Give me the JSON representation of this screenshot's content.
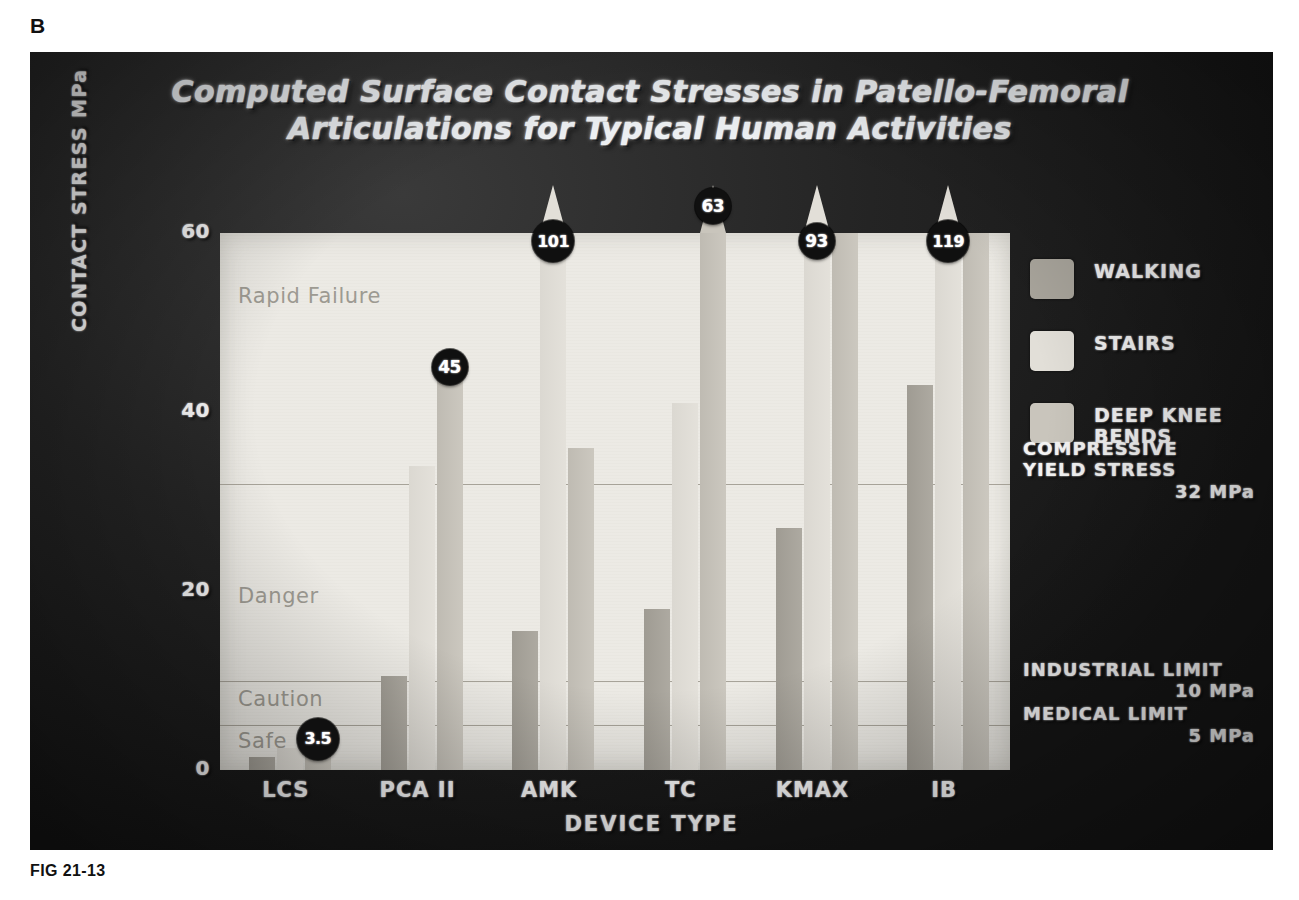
{
  "panel_label": "B",
  "caption": "FIG 21-13",
  "title": {
    "line1": "Computed Surface Contact Stresses in Patello-Femoral",
    "line2": "Articulations for Typical Human Activities"
  },
  "axes": {
    "y_title": "CONTACT STRESS MPa",
    "x_title": "DEVICE  TYPE",
    "y_ticks": [
      "0",
      "20",
      "40",
      "60"
    ]
  },
  "zones": [
    {
      "name": "Safe",
      "label": "Safe"
    },
    {
      "name": "Caution",
      "label": "Caution"
    },
    {
      "name": "Danger",
      "label": "Danger"
    },
    {
      "name": "Rapid Failure",
      "label": "Rapid Failure"
    }
  ],
  "legend": {
    "items": [
      {
        "label": "WALKING",
        "color": "#a9a59c"
      },
      {
        "label": "STAIRS",
        "color": "#e2dfd8"
      },
      {
        "label": "DEEP KNEE\nBENDS",
        "color": "#c9c5bc"
      }
    ]
  },
  "legend_labels": {
    "walking": "WALKING",
    "stairs": "STAIRS",
    "deep_knee_bends_l1": "DEEP KNEE",
    "deep_knee_bends_l2": "BENDS"
  },
  "annotations": [
    {
      "line1": "COMPRESSIVE",
      "line2": "YIELD STRESS",
      "value": "32 MPa",
      "at": 32
    },
    {
      "line1": "INDUSTRIAL  LIMIT",
      "line2": "",
      "value": "10 MPa",
      "at": 10
    },
    {
      "line1": "MEDICAL  LIMIT",
      "line2": "",
      "value": "5 MPa",
      "at": 5
    }
  ],
  "annotation_text": {
    "compressive_l1": "COMPRESSIVE",
    "compressive_l2": "YIELD STRESS",
    "compressive_val": "32 MPa",
    "industrial_l1": "INDUSTRIAL  LIMIT",
    "industrial_val": "10 MPa",
    "medical_l1": "MEDICAL  LIMIT",
    "medical_val": "5 MPa"
  },
  "chart_data": {
    "type": "bar",
    "title": "Computed Surface Contact Stresses in Patello-Femoral Articulations for Typical Human Activities",
    "xlabel": "DEVICE TYPE",
    "ylabel": "CONTACT STRESS MPa",
    "ylim": [
      0,
      60
    ],
    "yticks": [
      0,
      20,
      40,
      60
    ],
    "grid": true,
    "legend_position": "right",
    "categories": [
      "LCS",
      "PCA II",
      "AMK",
      "TC",
      "KMAX",
      "IB"
    ],
    "series": [
      {
        "name": "WALKING",
        "color": "#a9a59c",
        "values": [
          1.5,
          10.5,
          15.5,
          18.0,
          27.0,
          43.0
        ]
      },
      {
        "name": "STAIRS",
        "color": "#e2dfd8",
        "values": [
          2.5,
          34.0,
          101.0,
          41.0,
          93.0,
          119.0
        ]
      },
      {
        "name": "DEEP KNEE BENDS",
        "color": "#c9c5bc",
        "values": [
          3.5,
          45.0,
          36.0,
          63.0,
          60.0,
          60.0
        ]
      }
    ],
    "annotations": [
      {
        "category": "LCS",
        "series": "DEEP KNEE BENDS",
        "value": 3.5,
        "label": "3.5",
        "off_scale": false
      },
      {
        "category": "PCA II",
        "series": "DEEP KNEE BENDS",
        "value": 45,
        "label": "45",
        "off_scale": false
      },
      {
        "category": "AMK",
        "series": "STAIRS",
        "value": 101,
        "label": "101",
        "off_scale": true
      },
      {
        "category": "TC",
        "series": "DEEP KNEE BENDS",
        "value": 63,
        "label": "63",
        "off_scale": false
      },
      {
        "category": "KMAX",
        "series": "STAIRS",
        "value": 93,
        "label": "93",
        "off_scale": true
      },
      {
        "category": "IB",
        "series": "STAIRS",
        "value": 119,
        "label": "119",
        "off_scale": true
      }
    ],
    "reference_lines": [
      {
        "label": "COMPRESSIVE YIELD STRESS",
        "value": 32,
        "unit": "MPa"
      },
      {
        "label": "INDUSTRIAL LIMIT",
        "value": 10,
        "unit": "MPa"
      },
      {
        "label": "MEDICAL LIMIT",
        "value": 5,
        "unit": "MPa"
      }
    ],
    "zone_bands": [
      {
        "label": "Safe",
        "from": 0,
        "to": 5
      },
      {
        "label": "Caution",
        "from": 5,
        "to": 10
      },
      {
        "label": "Danger",
        "from": 10,
        "to": 32
      },
      {
        "label": "Rapid Failure",
        "from": 32,
        "to": 60
      }
    ]
  }
}
